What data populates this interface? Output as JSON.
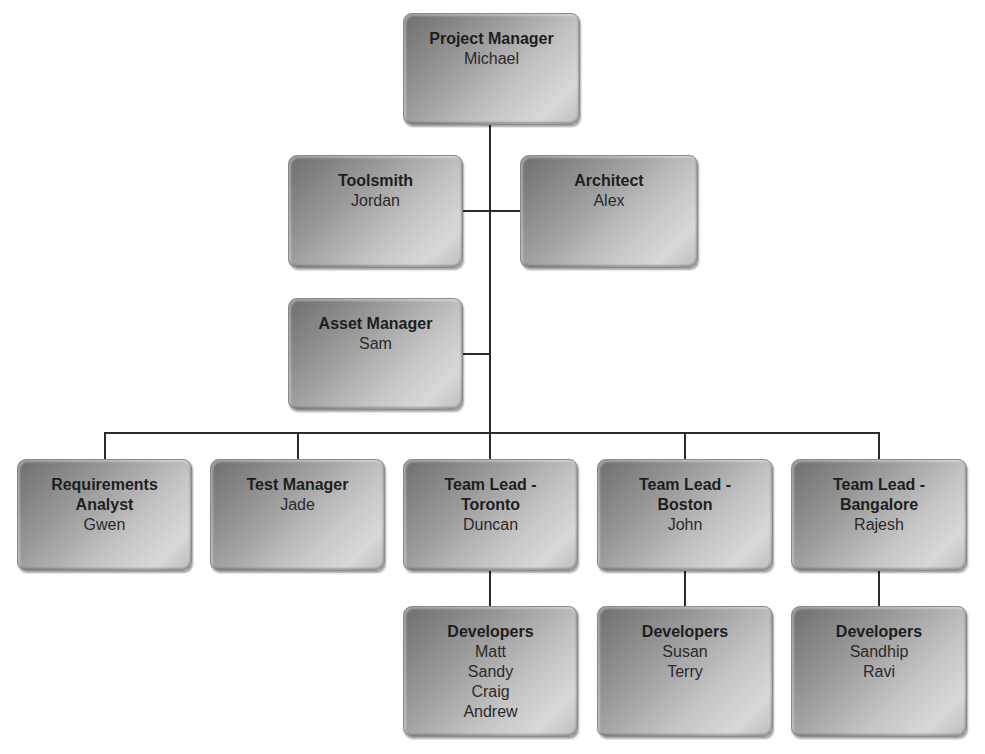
{
  "chart_title": "",
  "nodes": {
    "pm": {
      "title": "Project Manager",
      "names": [
        "Michael"
      ]
    },
    "toolsmith": {
      "title": "Toolsmith",
      "names": [
        "Jordan"
      ]
    },
    "architect": {
      "title": "Architect",
      "names": [
        "Alex"
      ]
    },
    "asset": {
      "title": "Asset Manager",
      "names": [
        "Sam"
      ]
    },
    "req": {
      "title": [
        "Requirements",
        "Analyst"
      ],
      "names": [
        "Gwen"
      ]
    },
    "test": {
      "title": "Test Manager",
      "names": [
        "Jade"
      ]
    },
    "toronto": {
      "title": [
        "Team Lead -",
        "Toronto"
      ],
      "names": [
        "Duncan"
      ]
    },
    "boston": {
      "title": [
        "Team Lead -",
        "Boston"
      ],
      "names": [
        "John"
      ]
    },
    "bangalore": {
      "title": [
        "Team Lead -",
        "Bangalore"
      ],
      "names": [
        "Rajesh"
      ]
    },
    "dev_toronto": {
      "title": "Developers",
      "names": [
        "Matt",
        "Sandy",
        "Craig",
        "Andrew"
      ]
    },
    "dev_boston": {
      "title": "Developers",
      "names": [
        "Susan",
        "Terry"
      ]
    },
    "dev_bangalore": {
      "title": "Developers",
      "names": [
        "Sandhip",
        "Ravi"
      ]
    }
  },
  "colors": {
    "line": "#2a2a2a",
    "box_dark": "#6e6e6e",
    "box_light": "#d8d8d8"
  }
}
